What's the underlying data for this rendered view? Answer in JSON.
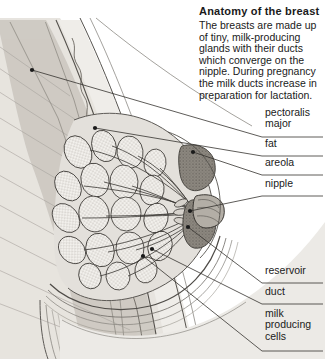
{
  "figure": {
    "title": "Anatomy of the breast",
    "intro": "The breasts are made up of tiny, milk-producing glands with their ducts which converge on the nipple. During pregnancy the milk ducts increase in preparation for lactation.",
    "type": "anatomical-cross-section-illustration"
  },
  "labels": [
    {
      "id": "pectoralis-major",
      "text": "pectoralis\nmajor",
      "x": 265,
      "y": 113,
      "rule_y": 137,
      "leader": {
        "from_x": 32,
        "from_y": 70,
        "to_x": 262,
        "to_y": 137
      }
    },
    {
      "id": "fat",
      "text": "fat",
      "x": 265,
      "y": 143,
      "rule_y": 156,
      "leader": {
        "from_x": 95,
        "from_y": 128,
        "to_x": 262,
        "to_y": 156
      }
    },
    {
      "id": "areola",
      "text": "areola",
      "x": 265,
      "y": 162,
      "rule_y": 175,
      "leader": {
        "from_x": 193,
        "from_y": 152,
        "to_x": 262,
        "to_y": 175
      }
    },
    {
      "id": "nipple",
      "text": "nipple",
      "x": 265,
      "y": 182,
      "rule_y": 196,
      "leader": {
        "from_x": 190,
        "from_y": 211,
        "to_x": 262,
        "to_y": 196
      }
    },
    {
      "id": "reservoir",
      "text": "reservoir",
      "x": 265,
      "y": 270,
      "rule_y": 283,
      "leader": {
        "from_x": 188,
        "from_y": 227,
        "to_x": 262,
        "to_y": 283
      }
    },
    {
      "id": "duct",
      "text": "duct",
      "x": 265,
      "y": 291,
      "rule_y": 304,
      "leader": {
        "from_x": 152,
        "from_y": 249,
        "to_x": 262,
        "to_y": 304
      }
    },
    {
      "id": "milk-producing-cells",
      "text": "milk\nproducing\ncells",
      "x": 265,
      "y": 317,
      "rule_y": 351,
      "leader": {
        "from_x": 143,
        "from_y": 256,
        "to_x": 262,
        "to_y": 351
      }
    }
  ],
  "colors": {
    "ink": "#1a1a1a",
    "line": "#3a3a3a",
    "skin": "#d8d4ce",
    "fat": "#eceae6",
    "muscle": "#b9b5ae",
    "gland": "#f2f0ec",
    "areola": "#8d8880",
    "background": "#ffffff",
    "chest_wall": "#cfcbc4"
  }
}
